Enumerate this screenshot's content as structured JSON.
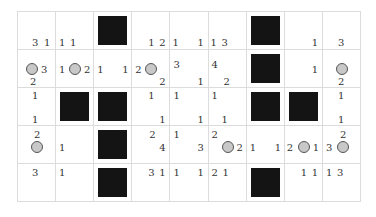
{
  "puzzle": {
    "rows": 5,
    "cols": 9,
    "colors": {
      "block": "#141414",
      "circle_fill": "#c8c8c8",
      "circle_border": "#555555",
      "grid_line": "#dcdcdc"
    },
    "cells": [
      [
        {
          "type": "empty",
          "clues": [
            {
              "v": "3",
              "x": 14,
              "y": 26
            },
            {
              "v": "1",
              "x": 26,
              "y": 26
            }
          ]
        },
        {
          "type": "empty",
          "clues": [
            {
              "v": "1",
              "x": 3,
              "y": 26
            },
            {
              "v": "1",
              "x": 14,
              "y": 26
            }
          ]
        },
        {
          "type": "block"
        },
        {
          "type": "empty",
          "clues": [
            {
              "v": "1",
              "x": 16,
              "y": 26
            },
            {
              "v": "2",
              "x": 27,
              "y": 26
            }
          ]
        },
        {
          "type": "empty",
          "clues": [
            {
              "v": "1",
              "x": 2,
              "y": 26
            },
            {
              "v": "1",
              "x": 27,
              "y": 26
            }
          ]
        },
        {
          "type": "empty",
          "clues": [
            {
              "v": "1",
              "x": 2,
              "y": 26
            },
            {
              "v": "3",
              "x": 13,
              "y": 26
            }
          ]
        },
        {
          "type": "block"
        },
        {
          "type": "empty",
          "clues": [
            {
              "v": "1",
              "x": 27,
              "y": 26
            }
          ]
        },
        {
          "type": "empty",
          "clues": [
            {
              "v": "3",
              "x": 15,
              "y": 26
            }
          ]
        }
      ],
      [
        {
          "type": "circle",
          "circle": {
            "x": 8,
            "y": 13
          },
          "clues": [
            {
              "v": "3",
              "x": 23,
              "y": 15
            },
            {
              "v": "2",
              "x": 12,
              "y": 27
            }
          ]
        },
        {
          "type": "circle",
          "circle": {
            "x": 13,
            "y": 13
          },
          "clues": [
            {
              "v": "1",
              "x": 3,
              "y": 15
            },
            {
              "v": "2",
              "x": 28,
              "y": 15
            }
          ]
        },
        {
          "type": "empty",
          "clues": [
            {
              "v": "1",
              "x": 3,
              "y": 15
            },
            {
              "v": "1",
              "x": 28,
              "y": 15
            }
          ]
        },
        {
          "type": "circle",
          "circle": {
            "x": 13,
            "y": 13
          },
          "clues": [
            {
              "v": "2",
              "x": 3,
              "y": 15
            },
            {
              "v": "2",
              "x": 27,
              "y": 27
            }
          ]
        },
        {
          "type": "empty",
          "clues": [
            {
              "v": "3",
              "x": 3,
              "y": 10
            },
            {
              "v": "1",
              "x": 27,
              "y": 27
            }
          ]
        },
        {
          "type": "empty",
          "clues": [
            {
              "v": "4",
              "x": 3,
              "y": 10
            },
            {
              "v": "2",
              "x": 15,
              "y": 27
            }
          ]
        },
        {
          "type": "block"
        },
        {
          "type": "empty",
          "clues": [
            {
              "v": "1",
              "x": 27,
              "y": 15
            }
          ]
        },
        {
          "type": "circle",
          "circle": {
            "x": 13,
            "y": 13
          },
          "clues": [
            {
              "v": "2",
              "x": 15,
              "y": 27
            }
          ]
        }
      ],
      [
        {
          "type": "empty",
          "clues": [
            {
              "v": "1",
              "x": 14,
              "y": 3
            },
            {
              "v": "1",
              "x": 14,
              "y": 27
            }
          ]
        },
        {
          "type": "block"
        },
        {
          "type": "block"
        },
        {
          "type": "empty",
          "clues": [
            {
              "v": "1",
              "x": 16,
              "y": 3
            },
            {
              "v": "1",
              "x": 27,
              "y": 27
            }
          ]
        },
        {
          "type": "empty",
          "clues": [
            {
              "v": "1",
              "x": 3,
              "y": 3
            },
            {
              "v": "1",
              "x": 27,
              "y": 27
            }
          ]
        },
        {
          "type": "empty",
          "clues": [
            {
              "v": "1",
              "x": 3,
              "y": 3
            },
            {
              "v": "1",
              "x": 13,
              "y": 27
            }
          ]
        },
        {
          "type": "block"
        },
        {
          "type": "block"
        },
        {
          "type": "empty",
          "clues": [
            {
              "v": "1",
              "x": 15,
              "y": 3
            },
            {
              "v": "1",
              "x": 15,
              "y": 27
            }
          ]
        }
      ],
      [
        {
          "type": "circle",
          "circle": {
            "x": 13,
            "y": 15
          },
          "clues": [
            {
              "v": "2",
              "x": 16,
              "y": 4
            }
          ]
        },
        {
          "type": "empty",
          "clues": [
            {
              "v": "1",
              "x": 3,
              "y": 17
            }
          ]
        },
        {
          "type": "block"
        },
        {
          "type": "empty",
          "clues": [
            {
              "v": "2",
              "x": 17,
              "y": 4
            },
            {
              "v": "4",
              "x": 27,
              "y": 17
            }
          ]
        },
        {
          "type": "empty",
          "clues": [
            {
              "v": "1",
              "x": 3,
              "y": 4
            },
            {
              "v": "3",
              "x": 27,
              "y": 17
            }
          ]
        },
        {
          "type": "circle",
          "circle": {
            "x": 13,
            "y": 15
          },
          "clues": [
            {
              "v": "2",
              "x": 3,
              "y": 4
            },
            {
              "v": "2",
              "x": 28,
              "y": 17
            }
          ]
        },
        {
          "type": "empty",
          "clues": [
            {
              "v": "1",
              "x": 3,
              "y": 17
            },
            {
              "v": "1",
              "x": 28,
              "y": 17
            }
          ]
        },
        {
          "type": "circle",
          "circle": {
            "x": 13,
            "y": 15
          },
          "clues": [
            {
              "v": "2",
              "x": 2,
              "y": 17
            },
            {
              "v": "1",
              "x": 28,
              "y": 17
            }
          ]
        },
        {
          "type": "circle",
          "circle": {
            "x": 14,
            "y": 15
          },
          "clues": [
            {
              "v": "3",
              "x": 3,
              "y": 17
            },
            {
              "v": "2",
              "x": 17,
              "y": 4
            }
          ]
        }
      ],
      [
        {
          "type": "empty",
          "clues": [
            {
              "v": "3",
              "x": 14,
              "y": 4
            }
          ]
        },
        {
          "type": "empty",
          "clues": [
            {
              "v": "1",
              "x": 3,
              "y": 4
            }
          ]
        },
        {
          "type": "block"
        },
        {
          "type": "empty",
          "clues": [
            {
              "v": "3",
              "x": 16,
              "y": 4
            },
            {
              "v": "1",
              "x": 27,
              "y": 4
            }
          ]
        },
        {
          "type": "empty",
          "clues": [
            {
              "v": "1",
              "x": 3,
              "y": 4
            },
            {
              "v": "1",
              "x": 27,
              "y": 4
            }
          ]
        },
        {
          "type": "empty",
          "clues": [
            {
              "v": "2",
              "x": 3,
              "y": 4
            },
            {
              "v": "1",
              "x": 14,
              "y": 4
            }
          ]
        },
        {
          "type": "block"
        },
        {
          "type": "empty",
          "clues": [
            {
              "v": "1",
              "x": 16,
              "y": 4
            },
            {
              "v": "1",
              "x": 27,
              "y": 4
            }
          ]
        },
        {
          "type": "empty",
          "clues": [
            {
              "v": "1",
              "x": 3,
              "y": 4
            },
            {
              "v": "3",
              "x": 14,
              "y": 4
            }
          ]
        }
      ]
    ]
  }
}
